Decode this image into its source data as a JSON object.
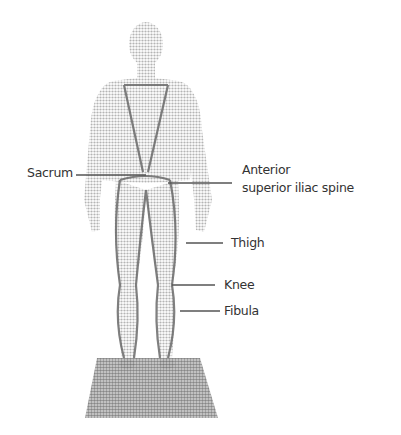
{
  "diagram": {
    "type": "anatomical-figure",
    "view": "posterior standing figure on platform",
    "labels": [
      {
        "id": "sacrum",
        "text": "Sacrum"
      },
      {
        "id": "asis",
        "text_line1": "Anterior",
        "text_line2": "superior iliac spine"
      },
      {
        "id": "thigh",
        "text": "Thigh"
      },
      {
        "id": "knee",
        "text": "Knee"
      },
      {
        "id": "fibula",
        "text": "Fibula"
      }
    ]
  },
  "colors": {
    "figure": "#c8c8c8",
    "figure_outline": "#9a9a9a",
    "lines": "#555555",
    "platform": "#a8a8a8",
    "text": "#333333"
  }
}
